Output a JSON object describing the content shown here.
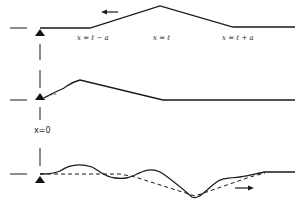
{
  "diagram": {
    "colors": {
      "line": "#1a1a1a",
      "background": "#ffffff"
    },
    "panels": [
      {
        "id": "top",
        "labels": [
          "x = ℓ − a",
          "x = ℓ",
          "x = ℓ + a"
        ],
        "arrow": "left-arrow",
        "shape": "triangular pulse"
      },
      {
        "id": "middle",
        "labels": [
          "x=0"
        ],
        "shape": "pulse reaching support, partially reflected"
      },
      {
        "id": "bottom",
        "labels": [],
        "arrow": "right-arrow",
        "shape": "distorted reflected wave (solid) vs ideal reflected triangle (dashed)"
      }
    ],
    "support_icon": "triangle-support-icon"
  }
}
